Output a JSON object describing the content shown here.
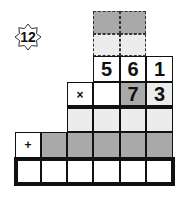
{
  "badge": {
    "label": "12",
    "icon": "eight-point-star-icon"
  },
  "puzzle": {
    "type": "long multiplication",
    "carry_rows": [
      {
        "style": "dashed",
        "cells": [
          {
            "value": "",
            "shade": "dark"
          },
          {
            "value": "",
            "shade": "dark"
          }
        ]
      },
      {
        "style": "dashed",
        "cells": [
          {
            "value": "",
            "shade": "light"
          },
          {
            "value": "",
            "shade": "light"
          }
        ]
      }
    ],
    "multiplicand": [
      "5",
      "6",
      "1"
    ],
    "multiplier_operator": "×",
    "multiplier": [
      "",
      "7",
      "3"
    ],
    "partial_product_1": [
      "",
      "",
      "",
      ""
    ],
    "addition_operator": "+",
    "partial_product_2": [
      "",
      "",
      "",
      "",
      ""
    ],
    "result": [
      "",
      "",
      "",
      "",
      "",
      ""
    ]
  },
  "colors": {
    "dark_cell": "#a9a9a9",
    "light_cell": "#ececec",
    "line": "#111111"
  }
}
